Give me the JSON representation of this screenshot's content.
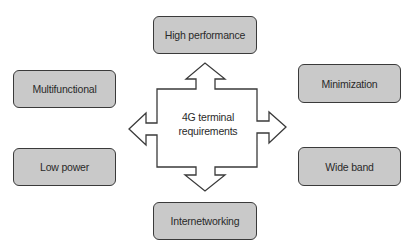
{
  "diagram": {
    "center": {
      "line1": "4G terminal",
      "line2": "requirements"
    },
    "nodes": [
      {
        "id": "high-performance",
        "label": "High performance",
        "position": "top"
      },
      {
        "id": "multifunctional",
        "label": "Multifunctional",
        "position": "upper-left"
      },
      {
        "id": "minimization",
        "label": "Minimization",
        "position": "upper-right"
      },
      {
        "id": "low-power",
        "label": "Low power",
        "position": "lower-left"
      },
      {
        "id": "wide-band",
        "label": "Wide band",
        "position": "lower-right"
      },
      {
        "id": "internetworking",
        "label": "Internetworking",
        "position": "bottom"
      }
    ],
    "colors": {
      "box_fill": "#c9c9c9",
      "box_border": "#3a3a3a",
      "arrow_fill": "#ffffff",
      "arrow_stroke": "#3a3a3a"
    }
  }
}
